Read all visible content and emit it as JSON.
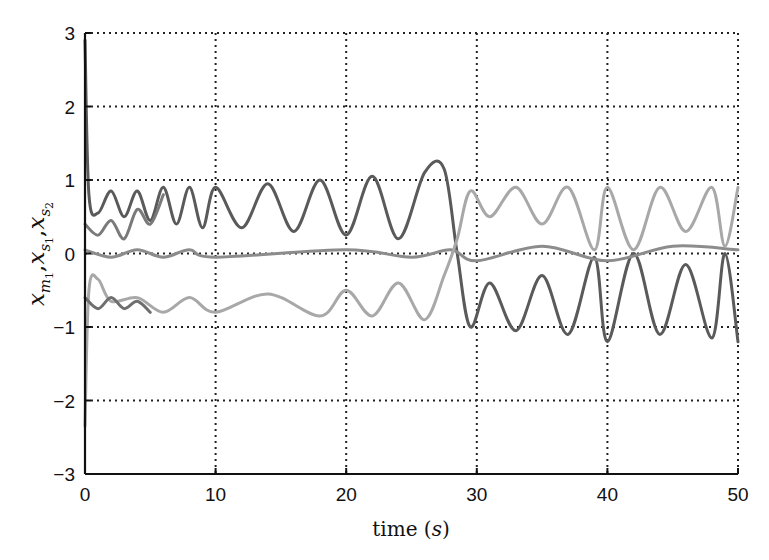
{
  "chart_data": {
    "type": "line",
    "title": "",
    "xlabel": "time (s)",
    "xlabel_main": "time",
    "xlabel_unit": "s",
    "ylabel": "x_{m1}, x_{s1}, x_{s2}",
    "ylabel_parts": [
      "x",
      "m",
      "1",
      ",",
      "x",
      "s",
      "1",
      ",",
      "x",
      "s",
      "2"
    ],
    "xlim": [
      0,
      50
    ],
    "ylim": [
      -3,
      3
    ],
    "xticks": [
      0,
      10,
      20,
      30,
      40,
      50
    ],
    "yticks": [
      -3,
      -2,
      -1,
      0,
      1,
      2,
      3
    ],
    "xtick_labels": [
      "0",
      "10",
      "20",
      "30",
      "40",
      "50"
    ],
    "ytick_labels": [
      "−3",
      "−2",
      "−1",
      "0",
      "1",
      "2",
      "3"
    ],
    "grid": true,
    "grid_style": "dotted",
    "legend": null,
    "series": [
      {
        "name": "upper trajectory (dark gray)",
        "color": "#5a5a5a",
        "description": "Oscillates around ~0.65 with amplitude ~0.2 for t<20, amplitude grows to ~0.35 (peaks up to 1.15) for 20-28, crosses down near t=28, then oscillates between ~-1.2 and ~0 for t>30",
        "points": [
          [
            0,
            2.9
          ],
          [
            0.3,
            0.8
          ],
          [
            1,
            0.55
          ],
          [
            2,
            0.85
          ],
          [
            3,
            0.5
          ],
          [
            4,
            0.85
          ],
          [
            5,
            0.45
          ],
          [
            6,
            0.9
          ],
          [
            7,
            0.4
          ],
          [
            8,
            0.9
          ],
          [
            9,
            0.35
          ],
          [
            10,
            0.9
          ],
          [
            12,
            0.35
          ],
          [
            14,
            0.95
          ],
          [
            16,
            0.3
          ],
          [
            18,
            1.0
          ],
          [
            20,
            0.25
          ],
          [
            22,
            1.05
          ],
          [
            24,
            0.2
          ],
          [
            26,
            1.1
          ],
          [
            27.5,
            1.15
          ],
          [
            28.5,
            0
          ],
          [
            29.5,
            -1.0
          ],
          [
            31,
            -0.4
          ],
          [
            33,
            -1.05
          ],
          [
            35,
            -0.3
          ],
          [
            37,
            -1.1
          ],
          [
            39,
            -0.05
          ],
          [
            40,
            -1.2
          ],
          [
            42,
            0
          ],
          [
            44,
            -1.1
          ],
          [
            46,
            -0.15
          ],
          [
            48,
            -1.15
          ],
          [
            49,
            0
          ],
          [
            50,
            -1.2
          ]
        ]
      },
      {
        "name": "middle trajectory (medium gray)",
        "color": "#8c8c8c",
        "description": "Small oscillation around 0 with amplitude ~0.07 throughout, amplitude ~0.12 after t=30",
        "points": [
          [
            0,
            0.05
          ],
          [
            2,
            -0.05
          ],
          [
            4,
            0.05
          ],
          [
            6,
            -0.05
          ],
          [
            8,
            0.05
          ],
          [
            10,
            -0.05
          ],
          [
            20,
            0.05
          ],
          [
            25,
            -0.05
          ],
          [
            28,
            0.05
          ],
          [
            30,
            -0.1
          ],
          [
            35,
            0.1
          ],
          [
            40,
            -0.1
          ],
          [
            45,
            0.1
          ],
          [
            50,
            0.05
          ]
        ]
      },
      {
        "name": "lower trajectory (light gray)",
        "color": "#a8a8a8",
        "description": "Oscillates around ~-0.65 amplitude ~0.15 for t<20, amplitude grows 20-28, crosses up near t=28, then oscillates between ~0 and ~0.9 for t>30",
        "points": [
          [
            0,
            -2.35
          ],
          [
            0.3,
            -0.5
          ],
          [
            1,
            -0.35
          ],
          [
            2,
            -0.65
          ],
          [
            4,
            -0.6
          ],
          [
            6,
            -0.8
          ],
          [
            8,
            -0.6
          ],
          [
            10,
            -0.8
          ],
          [
            14,
            -0.55
          ],
          [
            18,
            -0.85
          ],
          [
            20,
            -0.5
          ],
          [
            22,
            -0.85
          ],
          [
            24,
            -0.4
          ],
          [
            26,
            -0.9
          ],
          [
            27.5,
            -0.3
          ],
          [
            28.5,
            0.2
          ],
          [
            29.5,
            0.85
          ],
          [
            31,
            0.5
          ],
          [
            33,
            0.9
          ],
          [
            35,
            0.4
          ],
          [
            37,
            0.9
          ],
          [
            39,
            0.05
          ],
          [
            40,
            0.9
          ],
          [
            42,
            0.05
          ],
          [
            44,
            0.9
          ],
          [
            46,
            0.3
          ],
          [
            48,
            0.9
          ],
          [
            49,
            0.1
          ],
          [
            50,
            0.9
          ]
        ]
      },
      {
        "name": "transient trajectory (dark gray, lower)",
        "color": "#6e6e6e",
        "description": "Starts near -0.6, oscillates around -0.7 amplitude ~0.1 and merges with lower trajectory by t≈5",
        "points": [
          [
            0,
            -0.6
          ],
          [
            1,
            -0.75
          ],
          [
            2,
            -0.6
          ],
          [
            3,
            -0.75
          ],
          [
            4,
            -0.65
          ],
          [
            5,
            -0.8
          ]
        ]
      },
      {
        "name": "transient trajectory (medium gray, upper)",
        "color": "#7a7a7a",
        "description": "Starts near 0.4, decays toward the upper trajectory by t≈6",
        "points": [
          [
            0,
            0.4
          ],
          [
            1,
            0.25
          ],
          [
            2,
            0.45
          ],
          [
            3,
            0.2
          ],
          [
            4,
            0.6
          ],
          [
            5,
            0.4
          ],
          [
            6,
            0.8
          ]
        ]
      }
    ]
  }
}
